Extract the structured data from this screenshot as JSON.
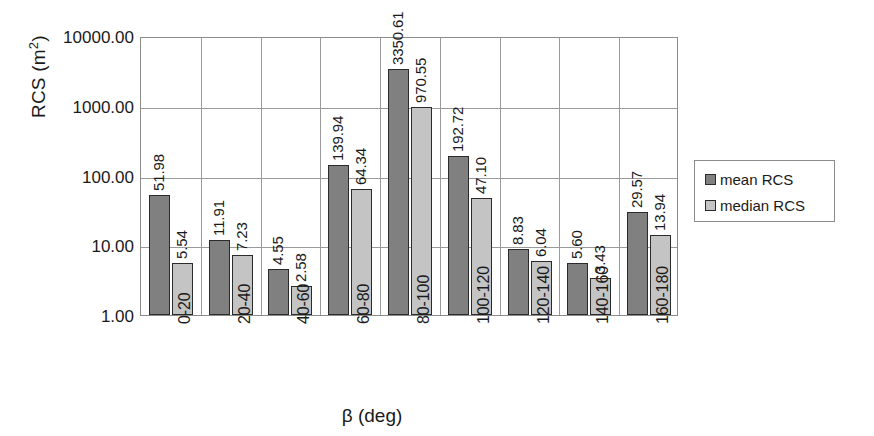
{
  "chart_data": {
    "type": "bar",
    "title": "",
    "xlabel": "β (deg)",
    "ylabel": "RCS (m²)",
    "ylabel_base": "RCS (m",
    "ylabel_sup": "2",
    "ylabel_close": ")",
    "yscale": "log",
    "ylim": [
      1.0,
      10000.0
    ],
    "grid": true,
    "legend_position": "right-outside",
    "y_ticks": [
      {
        "value": 10000.0,
        "label": "10000.00"
      },
      {
        "value": 1000.0,
        "label": "1000.00"
      },
      {
        "value": 100.0,
        "label": "100.00"
      },
      {
        "value": 10.0,
        "label": "10.00"
      },
      {
        "value": 1.0,
        "label": "1.00"
      }
    ],
    "categories": [
      "0-20",
      "20-40",
      "40-60",
      "60-80",
      "80-100",
      "100-120",
      "120-140",
      "140-160",
      "160-180"
    ],
    "series": [
      {
        "name": "mean RCS",
        "color": "#808080",
        "values": [
          51.98,
          11.91,
          4.55,
          139.94,
          3350.61,
          192.72,
          8.83,
          5.6,
          29.57
        ],
        "labels": [
          "51.98",
          "11.91",
          "4.55",
          "139.94",
          "3350.61",
          "192.72",
          "8.83",
          "5.60",
          "29.57"
        ]
      },
      {
        "name": "median RCS",
        "color": "#c4c4c4",
        "values": [
          5.54,
          7.23,
          2.58,
          64.34,
          970.55,
          47.1,
          6.04,
          3.43,
          13.94
        ],
        "labels": [
          "5.54",
          "7.23",
          "2.58",
          "64.34",
          "970.55",
          "47.10",
          "6.04",
          "3.43",
          "13.94"
        ]
      }
    ]
  },
  "legend": {
    "items": [
      {
        "label": "mean RCS",
        "color": "#808080"
      },
      {
        "label": "median RCS",
        "color": "#c4c4c4"
      }
    ]
  }
}
